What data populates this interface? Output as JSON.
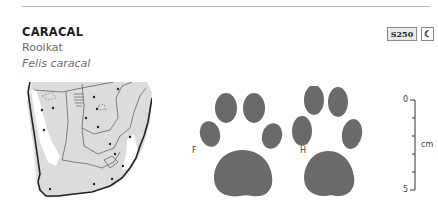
{
  "header": {
    "common_name": "CARACAL",
    "local_name": "Rooikat",
    "scientific_name": "Felis caracal",
    "page_ref": "S250",
    "activity_icon": "crescent-moon-icon",
    "activity_symbol": "☾"
  },
  "map": {
    "region": "Southern Africa distribution map"
  },
  "tracks": {
    "front_label": "F",
    "hind_label": "H",
    "print_color": "#6a6a6a"
  },
  "scale": {
    "min_label": "0",
    "max_label": "5",
    "unit": "cm"
  }
}
